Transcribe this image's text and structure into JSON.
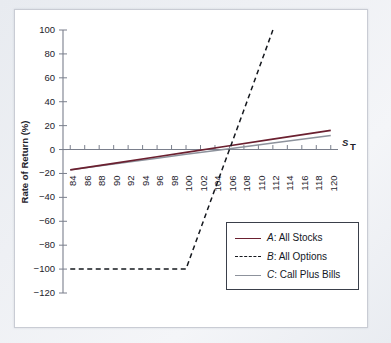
{
  "chart_data": {
    "type": "line",
    "title": "",
    "xlabel": "S_T",
    "ylabel": "Rate of Return (%)",
    "xlim": [
      83,
      121
    ],
    "ylim": [
      -120,
      100
    ],
    "grid": false,
    "legend_position": "lower-right",
    "x_ticks": [
      84,
      86,
      88,
      90,
      92,
      94,
      96,
      98,
      100,
      102,
      104,
      106,
      108,
      110,
      112,
      114,
      116,
      118,
      120
    ],
    "y_ticks": [
      100,
      80,
      60,
      40,
      20,
      0,
      -20,
      -40,
      -60,
      -80,
      -100,
      -120
    ],
    "series": [
      {
        "name": "A: All Stocks",
        "key": "A",
        "label": ": All Stocks",
        "style": "solid",
        "color": "#6b2030",
        "x": [
          84,
          90,
          96,
          100,
          106,
          112,
          120
        ],
        "values": [
          -17.0,
          -11.5,
          -6.0,
          -2.4,
          3.2,
          8.7,
          16.0
        ]
      },
      {
        "name": "B: All Options",
        "key": "B",
        "label": ": All Options",
        "style": "dashed",
        "color": "#15181e",
        "x": [
          84,
          90,
          96,
          100,
          104,
          108,
          112,
          115.5
        ],
        "values": [
          -100,
          -100,
          -100,
          -100,
          -33,
          33,
          100,
          155
        ]
      },
      {
        "name": "C: Call Plus Bills",
        "key": "C",
        "label": ": Call Plus Bills",
        "style": "solid",
        "color": "#8d929c",
        "x": [
          84,
          90,
          96,
          100,
          106,
          112,
          120
        ],
        "values": [
          -17.0,
          -12.0,
          -7.2,
          -4.0,
          0.6,
          5.4,
          11.8
        ]
      }
    ],
    "annotations": []
  },
  "legend": {
    "entries": [
      {
        "key": "A",
        "label": ": All Stocks",
        "swatch": "solid-dark-red"
      },
      {
        "key": "B",
        "label": ": All Options",
        "swatch": "dashed-black"
      },
      {
        "key": "C",
        "label": ": Call Plus Bills",
        "swatch": "solid-gray"
      }
    ]
  },
  "axis": {
    "y_title": "Rate of Return (%)",
    "x_title_main": "S",
    "x_title_sub": "T"
  }
}
